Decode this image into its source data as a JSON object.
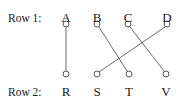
{
  "figure": {
    "width": 183,
    "height": 106,
    "background_color": "#ffffff",
    "stroke_color": "#6b6b6b",
    "node_stroke_color": "#555555",
    "node_fill_color": "#ffffff",
    "text_color": "#1a1a1a",
    "node_radius": 3,
    "stroke_width": 1
  },
  "row_labels": [
    {
      "id": "row-1",
      "text": "Row 1:",
      "x": 8,
      "y": 12
    },
    {
      "id": "row-2",
      "text": "Row 2:",
      "x": 8,
      "y": 86
    }
  ],
  "nodes": [
    {
      "id": "A",
      "label": "A",
      "row": 1,
      "cx": 66,
      "cy": 24,
      "label_x": 56,
      "label_y": 11
    },
    {
      "id": "B",
      "label": "B",
      "row": 1,
      "cx": 97,
      "cy": 24,
      "label_x": 87,
      "label_y": 11
    },
    {
      "id": "C",
      "label": "C",
      "row": 1,
      "cx": 128,
      "cy": 24,
      "label_x": 118,
      "label_y": 11
    },
    {
      "id": "D",
      "label": "D",
      "row": 1,
      "cx": 167,
      "cy": 24,
      "label_x": 157,
      "label_y": 11
    },
    {
      "id": "R",
      "label": "R",
      "row": 2,
      "cx": 66,
      "cy": 74,
      "label_x": 56,
      "label_y": 85
    },
    {
      "id": "S",
      "label": "S",
      "row": 2,
      "cx": 97,
      "cy": 74,
      "label_x": 87,
      "label_y": 85
    },
    {
      "id": "T",
      "label": "T",
      "row": 2,
      "cx": 129,
      "cy": 74,
      "label_x": 119,
      "label_y": 85
    },
    {
      "id": "V",
      "label": "V",
      "row": 2,
      "cx": 166,
      "cy": 74,
      "label_x": 156,
      "label_y": 85
    }
  ],
  "edges": [
    {
      "id": "edge-A-R",
      "from": "A",
      "to": "R",
      "x1": 66,
      "y1": 27,
      "x2": 66,
      "y2": 71
    },
    {
      "id": "edge-B-T",
      "from": "B",
      "to": "T",
      "x1": 99,
      "y1": 27,
      "x2": 127,
      "y2": 71
    },
    {
      "id": "edge-D-S",
      "from": "D",
      "to": "S",
      "x1": 165,
      "y1": 27,
      "x2": 99,
      "y2": 72
    },
    {
      "id": "edge-C-V",
      "from": "C",
      "to": "V",
      "x1": 130,
      "y1": 27,
      "x2": 164,
      "y2": 71
    }
  ]
}
